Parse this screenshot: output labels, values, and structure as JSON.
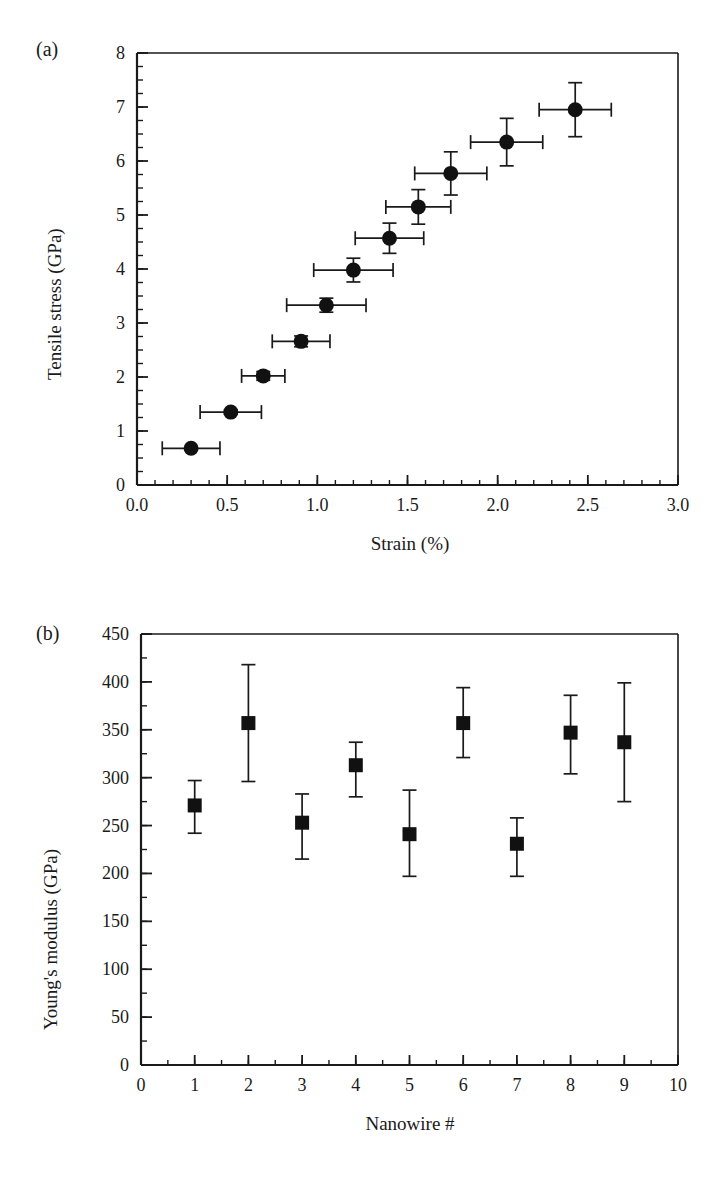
{
  "figure": {
    "panels": [
      {
        "tag": "(a)",
        "chart_data": {
          "type": "scatter",
          "title": "",
          "xlabel": "Strain (%)",
          "ylabel": "Tensile stress (GPa)",
          "xlim": [
            0.0,
            3.0
          ],
          "ylim": [
            0,
            8
          ],
          "xticks": [
            0.0,
            0.5,
            1.0,
            1.5,
            2.0,
            2.5,
            3.0
          ],
          "xtick_labels": [
            "0.0",
            "0.5",
            "1.0",
            "1.5",
            "2.0",
            "2.5",
            "3.0"
          ],
          "yticks": [
            0,
            1,
            2,
            3,
            4,
            5,
            6,
            7,
            8
          ],
          "ytick_labels": [
            "0",
            "1",
            "2",
            "3",
            "4",
            "5",
            "6",
            "7",
            "8"
          ],
          "x_minor_interval": 0.1,
          "y_minor_interval": 0.25,
          "grid": false,
          "legend": false,
          "marker": "filled-circle",
          "points": [
            {
              "x": 0.3,
              "y": 0.68,
              "xerr": 0.16,
              "yerr": 0.0
            },
            {
              "x": 0.52,
              "y": 1.35,
              "xerr": 0.17,
              "yerr": 0.04
            },
            {
              "x": 0.7,
              "y": 2.02,
              "xerr": 0.12,
              "yerr": 0.08
            },
            {
              "x": 0.91,
              "y": 2.66,
              "xerr": 0.16,
              "yerr": 0.1
            },
            {
              "x": 1.05,
              "y": 3.33,
              "xerr": 0.22,
              "yerr": 0.13
            },
            {
              "x": 1.2,
              "y": 3.98,
              "xerr": 0.22,
              "yerr": 0.22
            },
            {
              "x": 1.4,
              "y": 4.57,
              "xerr": 0.19,
              "yerr": 0.28
            },
            {
              "x": 1.56,
              "y": 5.15,
              "xerr": 0.18,
              "yerr": 0.32
            },
            {
              "x": 1.74,
              "y": 5.77,
              "xerr": 0.2,
              "yerr": 0.4
            },
            {
              "x": 2.05,
              "y": 6.35,
              "xerr": 0.2,
              "yerr": 0.44
            },
            {
              "x": 2.43,
              "y": 6.95,
              "xerr": 0.2,
              "yerr": 0.5
            }
          ]
        }
      },
      {
        "tag": "(b)",
        "chart_data": {
          "type": "scatter",
          "title": "",
          "xlabel": "Nanowire #",
          "ylabel": "Young's modulus (GPa)",
          "xlim": [
            0,
            10
          ],
          "ylim": [
            0,
            450
          ],
          "xticks": [
            0,
            1,
            2,
            3,
            4,
            5,
            6,
            7,
            8,
            9,
            10
          ],
          "xtick_labels": [
            "0",
            "1",
            "2",
            "3",
            "4",
            "5",
            "6",
            "7",
            "8",
            "9",
            "10"
          ],
          "yticks": [
            0,
            50,
            100,
            150,
            200,
            250,
            300,
            350,
            400,
            450
          ],
          "ytick_labels": [
            "0",
            "50",
            "100",
            "150",
            "200",
            "250",
            "300",
            "350",
            "400",
            "450"
          ],
          "x_minor_interval": 0.5,
          "y_minor_interval": 25,
          "grid": false,
          "legend": false,
          "marker": "filled-square",
          "categories": [
            1,
            2,
            3,
            4,
            5,
            6,
            7,
            8,
            9
          ],
          "values": [
            271,
            357,
            253,
            313,
            241,
            357,
            231,
            347,
            337
          ],
          "errors_upper": [
            26,
            61,
            30,
            24,
            46,
            37,
            27,
            39,
            62
          ],
          "errors_lower": [
            29,
            61,
            38,
            33,
            44,
            36,
            34,
            43,
            62
          ],
          "points": [
            {
              "x": 1,
              "y": 271,
              "yerr_up": 26,
              "yerr_dn": 29
            },
            {
              "x": 2,
              "y": 357,
              "yerr_up": 61,
              "yerr_dn": 61
            },
            {
              "x": 3,
              "y": 253,
              "yerr_up": 30,
              "yerr_dn": 38
            },
            {
              "x": 4,
              "y": 313,
              "yerr_up": 24,
              "yerr_dn": 33
            },
            {
              "x": 5,
              "y": 241,
              "yerr_up": 46,
              "yerr_dn": 44
            },
            {
              "x": 6,
              "y": 357,
              "yerr_up": 37,
              "yerr_dn": 36
            },
            {
              "x": 7,
              "y": 231,
              "yerr_up": 27,
              "yerr_dn": 34
            },
            {
              "x": 8,
              "y": 347,
              "yerr_up": 39,
              "yerr_dn": 43
            },
            {
              "x": 9,
              "y": 337,
              "yerr_up": 62,
              "yerr_dn": 62
            }
          ]
        }
      }
    ]
  }
}
